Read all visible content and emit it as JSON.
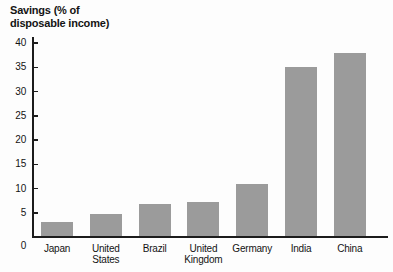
{
  "chart": {
    "title": "Savings (% of\ndisposable income)"
  },
  "chart_data": {
    "type": "bar",
    "title": "Savings (% of disposable income)",
    "categories": [
      "Japan",
      "United States",
      "Brazil",
      "United Kingdom",
      "Germany",
      "India",
      "China"
    ],
    "category_labels": [
      "Japan",
      "United\nStates",
      "Brazil",
      "United\nKingdom",
      "Germany",
      "India",
      "China"
    ],
    "values": [
      3,
      4.8,
      6.8,
      7.2,
      11,
      35,
      38
    ],
    "xlabel": "",
    "ylabel": "Savings (% of disposable income)",
    "ylim": [
      0,
      40
    ],
    "yticks": [
      0,
      5,
      10,
      15,
      20,
      25,
      30,
      35,
      40
    ],
    "grid": false,
    "legend": false,
    "colors": {
      "bar": "#9b9b9b",
      "axis": "#1c1c1c",
      "text": "#141414",
      "background": "#fdfdfd"
    }
  }
}
